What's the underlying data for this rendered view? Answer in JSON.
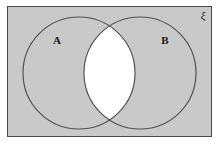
{
  "figure": {
    "type": "venn-diagram",
    "title_visible": false,
    "canvas": {
      "width": 220,
      "height": 142,
      "background": "#ffffff"
    },
    "universal_set": {
      "symbol": "ξ",
      "name": "xi-universal-set-symbol",
      "position": {
        "x": 203,
        "y": 19
      }
    },
    "frame": {
      "x": 7,
      "y": 6,
      "width": 205,
      "height": 131,
      "fill": "#c9c9c9",
      "stroke": "#4a4a4a",
      "stroke_width": 1
    },
    "sets": [
      {
        "label": "A",
        "name": "set-a",
        "cx": 79,
        "cy": 73,
        "r": 56,
        "fill": "#c9c9c9",
        "stroke": "#4f4f4f",
        "label_x": 57,
        "label_y": 44
      },
      {
        "label": "B",
        "name": "set-b",
        "cx": 140,
        "cy": 73,
        "r": 56,
        "fill": "#c9c9c9",
        "stroke": "#4f4f4f",
        "label_x": 165,
        "label_y": 44
      }
    ],
    "intersection": {
      "name": "a-intersect-b",
      "shaded": false,
      "fill": "#ffffff",
      "description": "A ∩ B"
    },
    "colors": {
      "shaded_region": "#c9c9c9",
      "highlight_region": "#ffffff",
      "outline": "#4f4f4f",
      "frame_border": "#4a4a4a",
      "text": "#161616"
    }
  }
}
